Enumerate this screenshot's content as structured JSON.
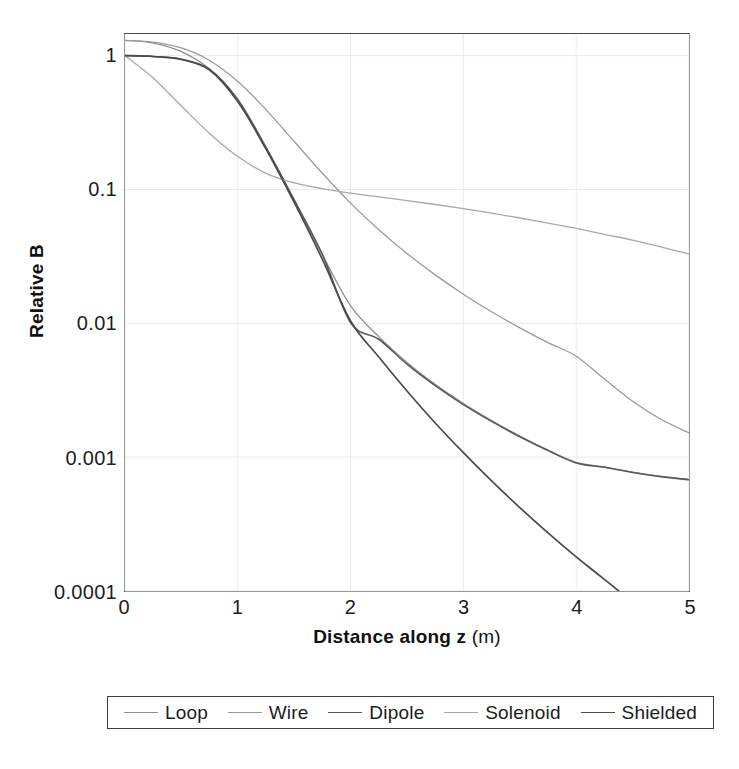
{
  "chart_data": {
    "type": "line",
    "title": "",
    "subtitle": "",
    "xlabel": "Distance along z (m)",
    "xlabel_bold_part": "Distance along z",
    "xlabel_unit_part": " (m)",
    "ylabel": "Relative B",
    "xscale": "linear",
    "yscale": "log",
    "xlim": [
      0,
      5
    ],
    "ylim": [
      0.0001,
      1.45
    ],
    "grid": true,
    "grid_style": "faint light gray, major x and y",
    "legend_position": "below plot, horizontal, boxed",
    "xticks": [
      {
        "value": 0,
        "label": "0"
      },
      {
        "value": 1,
        "label": "1"
      },
      {
        "value": 2,
        "label": "2"
      },
      {
        "value": 3,
        "label": "3"
      },
      {
        "value": 4,
        "label": "4"
      },
      {
        "value": 5,
        "label": "5"
      }
    ],
    "yticks": [
      {
        "value": 1,
        "label": "1"
      },
      {
        "value": 0.1,
        "label": "0.1"
      },
      {
        "value": 0.01,
        "label": "0.01"
      },
      {
        "value": 0.001,
        "label": "0.001"
      },
      {
        "value": 0.0001,
        "label": "0.0001"
      }
    ],
    "x": [
      0,
      0.25,
      0.5,
      0.75,
      1,
      1.25,
      1.5,
      1.75,
      2,
      2.25,
      2.5,
      2.75,
      3,
      3.25,
      3.5,
      3.75,
      4,
      4.25,
      4.5,
      4.75,
      5
    ],
    "series": [
      {
        "name": "Loop",
        "color": "#8f8f8f",
        "width": 1.3,
        "values": [
          1.3,
          1.24,
          1.07,
          0.79,
          0.45,
          0.205,
          0.083,
          0.0325,
          0.0135,
          0.00795,
          0.0051,
          0.0035,
          0.00252,
          0.00188,
          0.00144,
          0.00113,
          0.000915,
          0.000845,
          0.000772,
          0.000718,
          0.00068
        ]
      },
      {
        "name": "Wire",
        "color": "#9a9a9a",
        "width": 1.3,
        "values": [
          1.3,
          1.26,
          1.14,
          0.92,
          0.64,
          0.395,
          0.228,
          0.132,
          0.079,
          0.05,
          0.0332,
          0.023,
          0.0165,
          0.0122,
          0.00925,
          0.00718,
          0.00568,
          0.00384,
          0.00262,
          0.00192,
          0.00152
        ]
      },
      {
        "name": "Dipole",
        "color": "#5a5a5a",
        "width": 1.6,
        "values": [
          1.0,
          0.985,
          0.94,
          0.79,
          0.47,
          0.206,
          0.0835,
          0.0327,
          0.0101,
          0.0076,
          0.00495,
          0.00342,
          0.00247,
          0.00185,
          0.00142,
          0.00112,
          0.000905,
          0.00084,
          0.000768,
          0.000715,
          0.000678
        ]
      },
      {
        "name": "Solenoid",
        "color": "#a8a8a8",
        "width": 1.3,
        "values": [
          1.0,
          0.68,
          0.42,
          0.262,
          0.176,
          0.132,
          0.112,
          0.1015,
          0.094,
          0.088,
          0.0825,
          0.0772,
          0.0718,
          0.0665,
          0.0612,
          0.056,
          0.0512,
          0.0462,
          0.0418,
          0.0372,
          0.033
        ]
      },
      {
        "name": "Shielded",
        "color": "#4a4a4a",
        "width": 1.7,
        "values": [
          1.0,
          0.985,
          0.935,
          0.78,
          0.455,
          0.2,
          0.08,
          0.03,
          0.0104,
          0.0056,
          0.00312,
          0.0018,
          0.00108,
          0.000665,
          0.00042,
          0.000272,
          0.00018,
          0.000122,
          0.0,
          0.0,
          0.0
        ]
      }
    ],
    "legend_entries": [
      {
        "label": "Loop",
        "color": "#8f8f8f",
        "width": 1.4
      },
      {
        "label": "Wire",
        "color": "#9a9a9a",
        "width": 1.4
      },
      {
        "label": "Dipole",
        "color": "#5a5a5a",
        "width": 1.8
      },
      {
        "label": "Solenoid",
        "color": "#a8a8a8",
        "width": 1.4
      },
      {
        "label": "Shielded",
        "color": "#4a4a4a",
        "width": 1.9
      }
    ]
  }
}
